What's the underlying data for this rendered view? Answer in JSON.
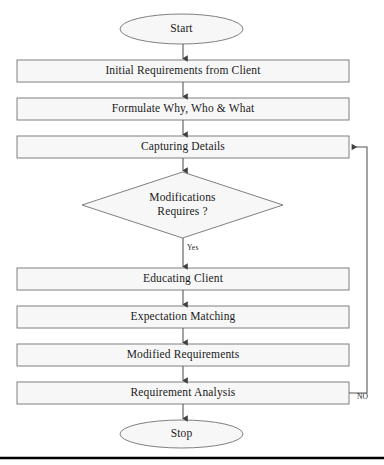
{
  "diagram": {
    "type": "flowchart",
    "colors": {
      "node_fill": "#f7f7f7",
      "node_stroke": "#808080",
      "connector": "#595959",
      "text": "#1a1a1a",
      "rule": "#000000",
      "background": "#ffffff"
    },
    "nodes": [
      {
        "id": "start",
        "shape": "ellipse",
        "label": "Start",
        "x": 120,
        "y": 14,
        "w": 123,
        "h": 30
      },
      {
        "id": "initial",
        "shape": "process",
        "label": "Initial Requirements from Client",
        "x": 17,
        "y": 60,
        "w": 332,
        "h": 22
      },
      {
        "id": "formulate",
        "shape": "process",
        "label": "Formulate Why, Who & What",
        "x": 17,
        "y": 98,
        "w": 332,
        "h": 22
      },
      {
        "id": "capturing",
        "shape": "process",
        "label": "Capturing Details",
        "x": 17,
        "y": 136,
        "w": 332,
        "h": 22
      },
      {
        "id": "decision",
        "shape": "diamond",
        "label": "Modifications\nRequires ?",
        "x": 82,
        "y": 172,
        "w": 201,
        "h": 66
      },
      {
        "id": "educating",
        "shape": "process",
        "label": "Educating Client",
        "x": 17,
        "y": 268,
        "w": 332,
        "h": 22
      },
      {
        "id": "expectation",
        "shape": "process",
        "label": "Expectation Matching",
        "x": 17,
        "y": 306,
        "w": 332,
        "h": 22
      },
      {
        "id": "modified",
        "shape": "process",
        "label": "Modified Requirements",
        "x": 17,
        "y": 344,
        "w": 332,
        "h": 22
      },
      {
        "id": "analysis",
        "shape": "process",
        "label": "Requirement Analysis",
        "x": 17,
        "y": 382,
        "w": 332,
        "h": 22
      },
      {
        "id": "stop",
        "shape": "ellipse",
        "label": "Stop",
        "x": 120,
        "y": 419,
        "w": 123,
        "h": 30
      }
    ],
    "edges": [
      {
        "id": "e-start-initial",
        "from": "start",
        "to": "initial",
        "label": ""
      },
      {
        "id": "e-initial-formulate",
        "from": "initial",
        "to": "formulate",
        "label": ""
      },
      {
        "id": "e-formulate-capturing",
        "from": "formulate",
        "to": "capturing",
        "label": ""
      },
      {
        "id": "e-capturing-decision",
        "from": "capturing",
        "to": "decision",
        "label": ""
      },
      {
        "id": "e-decision-educating",
        "from": "decision",
        "to": "educating",
        "label": "Yes"
      },
      {
        "id": "e-educating-expectation",
        "from": "educating",
        "to": "expectation",
        "label": ""
      },
      {
        "id": "e-expectation-modified",
        "from": "expectation",
        "to": "modified",
        "label": ""
      },
      {
        "id": "e-modified-analysis",
        "from": "modified",
        "to": "analysis",
        "label": ""
      },
      {
        "id": "e-analysis-stop",
        "from": "analysis",
        "to": "stop",
        "label": ""
      },
      {
        "id": "e-analysis-capturing",
        "from": "analysis",
        "to": "capturing",
        "label": "NO"
      }
    ],
    "edge_labels": {
      "yes": "Yes",
      "no": "NO"
    }
  }
}
